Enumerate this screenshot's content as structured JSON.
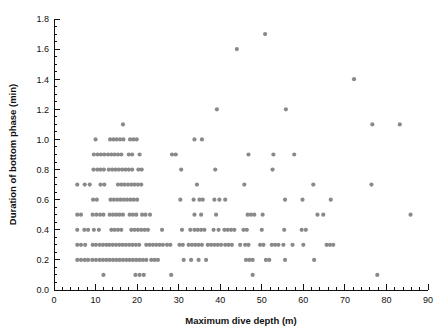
{
  "chart_data": {
    "type": "scatter",
    "title": "",
    "xlabel": "Maximum dive depth (m)",
    "ylabel": "Duration of bottom phase (min)",
    "xlim": [
      0,
      90
    ],
    "ylim": [
      0.0,
      1.8
    ],
    "x_ticks": [
      0,
      10,
      20,
      30,
      40,
      50,
      60,
      70,
      80,
      90
    ],
    "x_tick_labels": [
      "0",
      "10",
      "20",
      "30",
      "40",
      "50",
      "60",
      "70",
      "80",
      "90"
    ],
    "x_minor_tick_interval": 2,
    "y_ticks": [
      0.0,
      0.2,
      0.4,
      0.6,
      0.8,
      1.0,
      1.2,
      1.4,
      1.6,
      1.8
    ],
    "y_tick_labels": [
      "0.0",
      "0.2",
      "0.4",
      "0.6",
      "0.8",
      "1.0",
      "1.2",
      "1.4",
      "1.6",
      "1.8"
    ],
    "y_minor_tick_interval": 0.05,
    "grid": false,
    "legend": false,
    "marker": "circle",
    "marker_color": "#8a8a8a",
    "marker_size_px": 4.2,
    "axis_color": "#111111",
    "background_color": "#ffffff",
    "points": [
      [
        5.6,
        0.5
      ],
      [
        6.5,
        0.5
      ],
      [
        5.6,
        0.4
      ],
      [
        7.3,
        0.4
      ],
      [
        8.2,
        0.4
      ],
      [
        5.6,
        0.3
      ],
      [
        6.5,
        0.3
      ],
      [
        7.5,
        0.3
      ],
      [
        5.6,
        0.2
      ],
      [
        6.5,
        0.2
      ],
      [
        7.4,
        0.2
      ],
      [
        8.2,
        0.2
      ],
      [
        5.6,
        0.7
      ],
      [
        7.4,
        0.7
      ],
      [
        8.6,
        0.7
      ],
      [
        9.3,
        0.5
      ],
      [
        10.2,
        0.5
      ],
      [
        11.1,
        0.5
      ],
      [
        11.9,
        0.5
      ],
      [
        9.6,
        0.4
      ],
      [
        10.8,
        0.4
      ],
      [
        9.3,
        0.3
      ],
      [
        10.1,
        0.3
      ],
      [
        11.0,
        0.3
      ],
      [
        11.8,
        0.3
      ],
      [
        12.6,
        0.3
      ],
      [
        9.2,
        0.2
      ],
      [
        10.1,
        0.2
      ],
      [
        11.0,
        0.2
      ],
      [
        11.8,
        0.2
      ],
      [
        12.6,
        0.2
      ],
      [
        13.4,
        0.2
      ],
      [
        11.9,
        0.1
      ],
      [
        9.4,
        0.6
      ],
      [
        10.3,
        0.6
      ],
      [
        9.5,
        0.8
      ],
      [
        10.4,
        0.8
      ],
      [
        11.2,
        0.8
      ],
      [
        12.0,
        0.8
      ],
      [
        9.6,
        0.9
      ],
      [
        10.5,
        0.9
      ],
      [
        11.3,
        0.9
      ],
      [
        12.1,
        0.9
      ],
      [
        10.0,
        1.0
      ],
      [
        11.2,
        0.7
      ],
      [
        12.1,
        0.7
      ],
      [
        13.0,
        0.9
      ],
      [
        13.8,
        0.9
      ],
      [
        14.6,
        0.9
      ],
      [
        15.4,
        0.9
      ],
      [
        16.2,
        0.9
      ],
      [
        13.2,
        0.8
      ],
      [
        14.0,
        0.8
      ],
      [
        14.8,
        0.8
      ],
      [
        15.6,
        0.8
      ],
      [
        16.4,
        0.8
      ],
      [
        13.5,
        1.0
      ],
      [
        14.3,
        1.0
      ],
      [
        15.1,
        1.0
      ],
      [
        15.9,
        1.0
      ],
      [
        16.7,
        1.0
      ],
      [
        16.6,
        1.1
      ],
      [
        13.6,
        0.6
      ],
      [
        14.4,
        0.6
      ],
      [
        15.2,
        0.6
      ],
      [
        16.0,
        0.6
      ],
      [
        16.8,
        0.6
      ],
      [
        17.6,
        0.6
      ],
      [
        13.4,
        0.5
      ],
      [
        14.2,
        0.5
      ],
      [
        15.0,
        0.5
      ],
      [
        15.8,
        0.5
      ],
      [
        16.6,
        0.5
      ],
      [
        13.8,
        0.4
      ],
      [
        14.6,
        0.4
      ],
      [
        15.4,
        0.4
      ],
      [
        16.2,
        0.4
      ],
      [
        13.3,
        0.3
      ],
      [
        14.1,
        0.3
      ],
      [
        14.9,
        0.3
      ],
      [
        15.7,
        0.3
      ],
      [
        16.5,
        0.3
      ],
      [
        17.3,
        0.3
      ],
      [
        14.2,
        0.2
      ],
      [
        15.0,
        0.2
      ],
      [
        15.8,
        0.2
      ],
      [
        16.6,
        0.2
      ],
      [
        17.4,
        0.2
      ],
      [
        15.4,
        0.7
      ],
      [
        16.2,
        0.7
      ],
      [
        17.0,
        0.7
      ],
      [
        17.8,
        0.7
      ],
      [
        18.6,
        0.7
      ],
      [
        18.0,
        0.9
      ],
      [
        18.8,
        0.9
      ],
      [
        20.6,
        0.9
      ],
      [
        17.2,
        0.8
      ],
      [
        18.0,
        0.8
      ],
      [
        18.8,
        0.8
      ],
      [
        20.3,
        0.8
      ],
      [
        21.1,
        0.8
      ],
      [
        18.3,
        1.0
      ],
      [
        19.1,
        1.0
      ],
      [
        19.9,
        1.0
      ],
      [
        18.4,
        0.6
      ],
      [
        19.2,
        0.6
      ],
      [
        20.0,
        0.6
      ],
      [
        18.2,
        0.5
      ],
      [
        19.0,
        0.5
      ],
      [
        19.8,
        0.5
      ],
      [
        21.2,
        0.5
      ],
      [
        22.0,
        0.5
      ],
      [
        23.1,
        0.5
      ],
      [
        18.6,
        0.4
      ],
      [
        19.4,
        0.4
      ],
      [
        20.2,
        0.4
      ],
      [
        21.0,
        0.4
      ],
      [
        21.8,
        0.4
      ],
      [
        22.6,
        0.4
      ],
      [
        18.1,
        0.3
      ],
      [
        18.9,
        0.3
      ],
      [
        19.7,
        0.3
      ],
      [
        20.5,
        0.3
      ],
      [
        18.2,
        0.2
      ],
      [
        19.0,
        0.2
      ],
      [
        19.8,
        0.2
      ],
      [
        20.6,
        0.2
      ],
      [
        21.4,
        0.2
      ],
      [
        22.2,
        0.2
      ],
      [
        19.6,
        0.1
      ],
      [
        20.6,
        0.1
      ],
      [
        21.6,
        0.1
      ],
      [
        19.4,
        0.7
      ],
      [
        20.2,
        0.7
      ],
      [
        21.0,
        0.7
      ],
      [
        22.2,
        0.3
      ],
      [
        23.0,
        0.3
      ],
      [
        23.8,
        0.3
      ],
      [
        24.6,
        0.3
      ],
      [
        25.4,
        0.3
      ],
      [
        26.2,
        0.3
      ],
      [
        23.4,
        0.2
      ],
      [
        24.2,
        0.2
      ],
      [
        25.0,
        0.2
      ],
      [
        26.0,
        0.4
      ],
      [
        27.2,
        0.3
      ],
      [
        28.0,
        0.3
      ],
      [
        28.2,
        0.1
      ],
      [
        28.4,
        0.9
      ],
      [
        29.3,
        0.9
      ],
      [
        30.6,
        0.8
      ],
      [
        30.4,
        0.6
      ],
      [
        30.8,
        0.4
      ],
      [
        30.2,
        0.3
      ],
      [
        31.0,
        0.3
      ],
      [
        31.2,
        0.2
      ],
      [
        33.8,
        1.0
      ],
      [
        35.6,
        1.0
      ],
      [
        34.4,
        0.7
      ],
      [
        33.6,
        0.6
      ],
      [
        35.0,
        0.6
      ],
      [
        35.8,
        0.6
      ],
      [
        33.8,
        0.5
      ],
      [
        35.4,
        0.5
      ],
      [
        32.8,
        0.4
      ],
      [
        33.8,
        0.4
      ],
      [
        34.6,
        0.4
      ],
      [
        35.4,
        0.4
      ],
      [
        36.2,
        0.4
      ],
      [
        32.4,
        0.3
      ],
      [
        33.2,
        0.3
      ],
      [
        34.0,
        0.3
      ],
      [
        34.8,
        0.3
      ],
      [
        35.6,
        0.3
      ],
      [
        33.0,
        0.2
      ],
      [
        34.8,
        0.2
      ],
      [
        39.2,
        1.2
      ],
      [
        38.8,
        0.8
      ],
      [
        38.6,
        0.6
      ],
      [
        39.8,
        0.6
      ],
      [
        39.0,
        0.5
      ],
      [
        38.4,
        0.4
      ],
      [
        39.6,
        0.4
      ],
      [
        37.0,
        0.3
      ],
      [
        37.8,
        0.3
      ],
      [
        38.6,
        0.3
      ],
      [
        39.4,
        0.3
      ],
      [
        40.2,
        0.3
      ],
      [
        36.6,
        0.2
      ],
      [
        41.2,
        0.6
      ],
      [
        41.0,
        0.4
      ],
      [
        41.8,
        0.4
      ],
      [
        42.6,
        0.4
      ],
      [
        43.4,
        0.4
      ],
      [
        41.2,
        0.3
      ],
      [
        42.0,
        0.3
      ],
      [
        42.8,
        0.3
      ],
      [
        44.0,
        1.6
      ],
      [
        44.8,
        0.3
      ],
      [
        45.8,
        0.7
      ],
      [
        45.6,
        0.4
      ],
      [
        46.4,
        0.4
      ],
      [
        46.0,
        0.3
      ],
      [
        46.8,
        0.3
      ],
      [
        46.2,
        0.2
      ],
      [
        47.0,
        0.2
      ],
      [
        47.8,
        0.2
      ],
      [
        46.8,
        0.9
      ],
      [
        46.6,
        0.5
      ],
      [
        47.4,
        0.5
      ],
      [
        48.2,
        0.5
      ],
      [
        47.8,
        0.1
      ],
      [
        50.8,
        1.7
      ],
      [
        50.2,
        0.5
      ],
      [
        50.0,
        0.4
      ],
      [
        49.6,
        0.3
      ],
      [
        50.4,
        0.3
      ],
      [
        51.0,
        0.2
      ],
      [
        51.8,
        0.2
      ],
      [
        52.6,
        0.8
      ],
      [
        52.8,
        0.9
      ],
      [
        52.4,
        0.3
      ],
      [
        53.2,
        0.3
      ],
      [
        54.0,
        0.3
      ],
      [
        55.8,
        1.2
      ],
      [
        55.6,
        0.6
      ],
      [
        55.4,
        0.4
      ],
      [
        55.2,
        0.3
      ],
      [
        55.6,
        0.2
      ],
      [
        57.8,
        0.9
      ],
      [
        57.4,
        0.3
      ],
      [
        59.8,
        0.6
      ],
      [
        59.6,
        0.4
      ],
      [
        60.6,
        0.4
      ],
      [
        60.0,
        0.3
      ],
      [
        62.4,
        0.7
      ],
      [
        62.6,
        0.2
      ],
      [
        63.4,
        0.5
      ],
      [
        64.8,
        0.5
      ],
      [
        66.6,
        0.6
      ],
      [
        65.6,
        0.3
      ],
      [
        66.4,
        0.3
      ],
      [
        67.2,
        0.3
      ],
      [
        72.2,
        1.4
      ],
      [
        76.6,
        1.1
      ],
      [
        76.4,
        0.7
      ],
      [
        77.8,
        0.1
      ],
      [
        83.2,
        1.1
      ],
      [
        85.8,
        0.5
      ]
    ]
  }
}
